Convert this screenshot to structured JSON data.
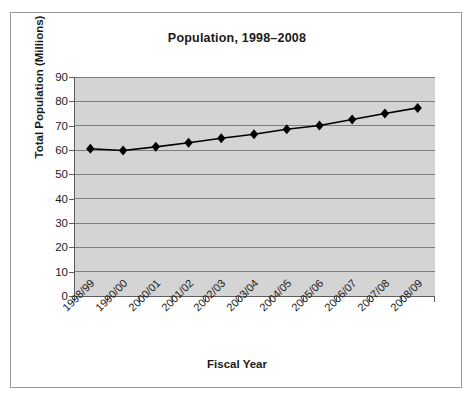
{
  "chart_data": {
    "type": "line",
    "title": "Population, 1998–2008",
    "xlabel": "Fiscal Year",
    "ylabel": "Total Population (Millions)",
    "categories": [
      "1998/99",
      "1990/00",
      "2000/01",
      "2001/02",
      "2002/03",
      "2003/04",
      "2004/05",
      "2005/06",
      "2006/07",
      "2007/08",
      "2008/09"
    ],
    "values": [
      60.5,
      59.8,
      61.3,
      63.0,
      64.8,
      66.5,
      68.5,
      70.1,
      72.5,
      75.0,
      77.3
    ],
    "series": [
      {
        "name": "Total Population",
        "values": [
          60.5,
          59.8,
          61.3,
          63.0,
          64.8,
          66.5,
          68.5,
          70.1,
          72.5,
          75.0,
          77.3
        ]
      }
    ],
    "ylim": [
      0,
      90
    ],
    "yticks": [
      0,
      10,
      20,
      30,
      40,
      50,
      60,
      70,
      80,
      90
    ],
    "ytick_labels": [
      "0",
      "10",
      "20",
      "30",
      "40",
      "50",
      "60",
      "70",
      "80",
      "90"
    ],
    "grid": "horizontal",
    "legend": "none",
    "marker": "diamond",
    "colors": {
      "line": "#000000",
      "marker": "#000000",
      "plot_background": "#d4d4d4",
      "gridline": "#7d7d7d",
      "axis": "#5d5d5d",
      "frame_border": "#9a9a9a",
      "text": "#1a1a1a",
      "page_background": "#ffffff"
    }
  }
}
